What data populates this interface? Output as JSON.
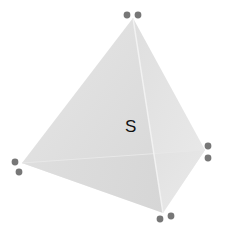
{
  "diagram": {
    "type": "tetrahedron",
    "label": "S",
    "colors": {
      "left_face": "#d9d9d9",
      "right_face": "#e6e6e6",
      "bottom_face": "#efefef",
      "dot": "#777777",
      "label": "#111111"
    },
    "vertices": {
      "apex": [
        133,
        18
      ],
      "left": [
        22,
        163
      ],
      "right": [
        205,
        150
      ],
      "bottom": [
        163,
        213
      ]
    },
    "dot_pairs": [
      {
        "vertex": "apex",
        "dots": [
          [
            127,
            15
          ],
          [
            138,
            15
          ]
        ]
      },
      {
        "vertex": "left",
        "dots": [
          [
            15,
            162
          ],
          [
            19,
            172
          ]
        ]
      },
      {
        "vertex": "right",
        "dots": [
          [
            208,
            146
          ],
          [
            208,
            158
          ]
        ]
      },
      {
        "vertex": "bottom",
        "dots": [
          [
            160,
            219
          ],
          [
            171,
            216
          ]
        ]
      }
    ]
  }
}
